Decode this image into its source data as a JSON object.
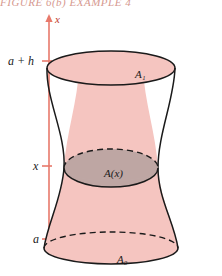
{
  "header": {
    "text": "FIGURE 6(b)    EXAMPLE 4"
  },
  "figure": {
    "axis": {
      "name": "x",
      "color": "#e8796b",
      "ticks": [
        {
          "label": "a + h",
          "value": "a + h"
        },
        {
          "label": "x",
          "value": "x"
        },
        {
          "label": "a",
          "value": "a"
        }
      ]
    },
    "solid": {
      "fill_color": "#f5c5c0",
      "outline_color": "#1a1a1a",
      "cross_section_color": "#b9a3a1",
      "labels": {
        "top": "A₁",
        "middle": "A(x)",
        "bottom": "A₀"
      }
    }
  }
}
